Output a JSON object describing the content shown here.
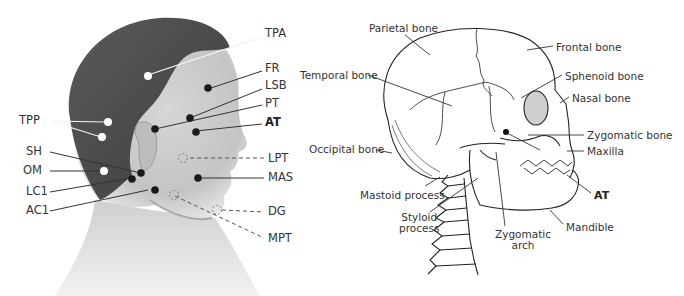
{
  "figure": {
    "left_panel": {
      "title": "Head photo with muscle/trigger-point markers",
      "labels": [
        {
          "id": "TPA",
          "text": "TPA",
          "x": 265,
          "y": 33,
          "bold": false
        },
        {
          "id": "FR",
          "text": "FR",
          "x": 265,
          "y": 67,
          "bold": false
        },
        {
          "id": "LSB",
          "text": "LSB",
          "x": 265,
          "y": 84,
          "bold": false
        },
        {
          "id": "PT",
          "text": "PT",
          "x": 265,
          "y": 101,
          "bold": false
        },
        {
          "id": "AT",
          "text": "AT",
          "x": 265,
          "y": 120,
          "bold": true
        },
        {
          "id": "TPP",
          "text": "TPP",
          "x": 20,
          "y": 116,
          "bold": false
        },
        {
          "id": "SH",
          "text": "SH",
          "x": 27,
          "y": 147,
          "bold": false
        },
        {
          "id": "OM",
          "text": "OM",
          "x": 24,
          "y": 166,
          "bold": false
        },
        {
          "id": "LPT",
          "text": "LPT",
          "x": 268,
          "y": 152,
          "bold": false
        },
        {
          "id": "MAS",
          "text": "MAS",
          "x": 268,
          "y": 172,
          "bold": false
        },
        {
          "id": "LC1",
          "text": "LC1",
          "x": 27,
          "y": 187,
          "bold": false
        },
        {
          "id": "AC1",
          "text": "AC1",
          "x": 27,
          "y": 206,
          "bold": false
        },
        {
          "id": "DG",
          "text": "DG",
          "x": 268,
          "y": 206,
          "bold": false
        },
        {
          "id": "MPT",
          "text": "MPT",
          "x": 268,
          "y": 234,
          "bold": false
        }
      ],
      "markers": {
        "white": [
          "TPA",
          "TPP-1",
          "TPP-2",
          "OM"
        ],
        "black": [
          "FR",
          "LSB",
          "PT",
          "AT",
          "SH",
          "LC1",
          "AC1",
          "MAS"
        ],
        "dashed_circle": [
          "LPT",
          "DG",
          "MPT"
        ]
      }
    },
    "right_panel": {
      "title": "Lateral skull diagram",
      "labels": [
        {
          "id": "parietal",
          "text": "Parietal bone",
          "x": 369,
          "y": 23
        },
        {
          "id": "frontal",
          "text": "Frontal bone",
          "x": 556,
          "y": 42
        },
        {
          "id": "temporal",
          "text": "Temporal bone",
          "x": 300,
          "y": 70
        },
        {
          "id": "sphenoid",
          "text": "Sphenoid bone",
          "x": 565,
          "y": 71
        },
        {
          "id": "nasal",
          "text": "Nasal bone",
          "x": 572,
          "y": 93
        },
        {
          "id": "zygomatic_bone",
          "text": "Zygomatic bone",
          "x": 587,
          "y": 130
        },
        {
          "id": "occipital",
          "text": "Occipital bone",
          "x": 309,
          "y": 144
        },
        {
          "id": "maxilla",
          "text": "Maxilla",
          "x": 587,
          "y": 146
        },
        {
          "id": "mastoid",
          "text": "Mastoid process",
          "x": 360,
          "y": 190
        },
        {
          "id": "at",
          "text": "AT",
          "x": 594,
          "y": 190,
          "bold": true
        },
        {
          "id": "styloid",
          "text": "Styloid\nprocess",
          "x": 399,
          "y": 212
        },
        {
          "id": "zyg_arch",
          "text": "Zygomatic\narch",
          "x": 495,
          "y": 229
        },
        {
          "id": "mandible",
          "text": "Mandible",
          "x": 566,
          "y": 222
        }
      ]
    }
  }
}
